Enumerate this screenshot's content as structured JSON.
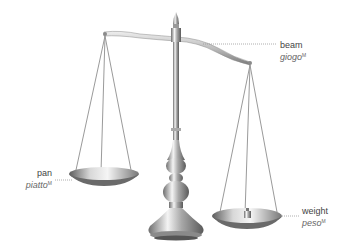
{
  "diagram": {
    "labels": [
      {
        "id": "beam",
        "term": "beam",
        "translation": "giogo",
        "gender": "M"
      },
      {
        "id": "pan",
        "term": "pan",
        "translation": "piatto",
        "gender": "M"
      },
      {
        "id": "weight",
        "term": "weight",
        "translation": "peso",
        "gender": "M"
      }
    ]
  },
  "colors": {
    "metal_light": "#f2f2f2",
    "metal_mid": "#b8b8b8",
    "metal_dark": "#6e6e6e",
    "leader_line": "#999999",
    "text": "#555555"
  }
}
